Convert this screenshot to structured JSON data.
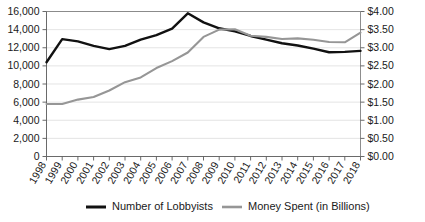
{
  "chart_data": {
    "type": "line",
    "title": "",
    "subtitle": "",
    "xlabel": "",
    "ylabel": "",
    "grid": true,
    "legend_position": "bottom",
    "categories": [
      "1998",
      "1999",
      "2000",
      "2001",
      "2002",
      "2003",
      "2004",
      "2005",
      "2006",
      "2007",
      "2008",
      "2009",
      "2010",
      "2011",
      "2012",
      "2013",
      "2014",
      "2015",
      "2016",
      "2017",
      "2018"
    ],
    "axes": {
      "left": {
        "label": "",
        "min": 0,
        "max": 16000,
        "step": 2000,
        "tick_labels": [
          "0",
          "2,000",
          "4,000",
          "6,000",
          "8,000",
          "10,000",
          "12,000",
          "14,000",
          "16,000"
        ]
      },
      "right": {
        "label": "",
        "min": 0,
        "max": 4.0,
        "step": 0.5,
        "tick_labels": [
          "$0.00",
          "$0.50",
          "$1.00",
          "$1.50",
          "$2.00",
          "$2.50",
          "$3.00",
          "$3.50",
          "$4.00"
        ]
      }
    },
    "series": [
      {
        "name": "Number of Lobbyists",
        "axis": "left",
        "color": "#111111",
        "values": [
          10400,
          12950,
          12700,
          12200,
          11850,
          12200,
          12900,
          13400,
          14100,
          15800,
          14800,
          14150,
          13800,
          13300,
          12900,
          12500,
          12250,
          11900,
          11500,
          11550,
          11650
        ]
      },
      {
        "name": "Money Spent (in Billions)",
        "axis": "right",
        "color": "#969696",
        "values": [
          1.45,
          1.45,
          1.57,
          1.64,
          1.82,
          2.05,
          2.18,
          2.44,
          2.63,
          2.87,
          3.3,
          3.5,
          3.51,
          3.33,
          3.3,
          3.24,
          3.26,
          3.22,
          3.16,
          3.15,
          3.42
        ]
      }
    ]
  },
  "legend": {
    "items": [
      {
        "label": "Number of Lobbyists",
        "color": "#111111"
      },
      {
        "label": "Money Spent (in Billions)",
        "color": "#969696"
      }
    ]
  }
}
